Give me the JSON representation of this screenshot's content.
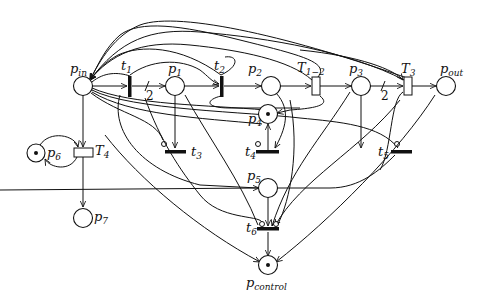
{
  "diagram": {
    "type": "petri-net",
    "places": [
      {
        "id": "p_in",
        "base": "p",
        "sub": "in",
        "tokens": 0
      },
      {
        "id": "p1",
        "base": "p",
        "sub": "1",
        "tokens": 0
      },
      {
        "id": "p2",
        "base": "p",
        "sub": "2",
        "tokens": 0
      },
      {
        "id": "p3",
        "base": "p",
        "sub": "3",
        "tokens": 0
      },
      {
        "id": "p4",
        "base": "p",
        "sub": "4",
        "tokens": 1
      },
      {
        "id": "p5",
        "base": "p",
        "sub": "5",
        "tokens": 0
      },
      {
        "id": "p6",
        "base": "p",
        "sub": "6",
        "tokens": 1
      },
      {
        "id": "p7",
        "base": "p",
        "sub": "7",
        "tokens": 0
      },
      {
        "id": "p_out",
        "base": "p",
        "sub": "out",
        "tokens": 0
      },
      {
        "id": "p_control",
        "base": "p",
        "sub": "control",
        "tokens": 1
      }
    ],
    "transitions": [
      {
        "id": "t1",
        "base": "t",
        "sub": "1",
        "kind": "immediate"
      },
      {
        "id": "t2",
        "base": "t",
        "sub": "2",
        "kind": "immediate"
      },
      {
        "id": "t3",
        "base": "t",
        "sub": "3",
        "kind": "immediate"
      },
      {
        "id": "t4",
        "base": "t",
        "sub": "4",
        "kind": "immediate"
      },
      {
        "id": "t5",
        "base": "t",
        "sub": "5",
        "kind": "immediate"
      },
      {
        "id": "t6",
        "base": "t",
        "sub": "6",
        "kind": "immediate"
      },
      {
        "id": "T1-2",
        "base": "T",
        "sub": "1−2",
        "kind": "timed"
      },
      {
        "id": "T3",
        "base": "T",
        "sub": "3",
        "kind": "timed"
      },
      {
        "id": "T4",
        "base": "T",
        "sub": "4",
        "kind": "timed"
      }
    ],
    "arc_weights": [
      {
        "from": "t1",
        "to": "p1",
        "weight": "2"
      },
      {
        "from": "p3",
        "to": "T3",
        "weight": "2"
      }
    ]
  }
}
